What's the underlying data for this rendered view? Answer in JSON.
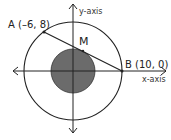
{
  "diagram": {
    "type": "coordinate-geometry",
    "colors": {
      "stroke": "#222222",
      "inner_fill": "#6b6b6b",
      "background": "#ffffff"
    },
    "axes": {
      "x_label": "x-axis",
      "y_label": "y-axis"
    },
    "points": {
      "A": {
        "name": "A",
        "coords": "(–6, 8)"
      },
      "B": {
        "name": "B",
        "coords": "(10, 0)"
      },
      "M": {
        "name": "M"
      }
    },
    "shapes": [
      {
        "kind": "circle",
        "role": "outer",
        "center": "origin",
        "passes_through": [
          "A",
          "B"
        ]
      },
      {
        "kind": "circle",
        "role": "inner",
        "center": "origin",
        "filled": true,
        "tangent_to": "AB at M"
      },
      {
        "kind": "segment",
        "from": "A",
        "to": "B"
      }
    ]
  },
  "labels": {
    "A": "A (–6, 8)",
    "B": "B (10, 0)",
    "M": "M",
    "x_axis": "x-axis",
    "y_axis": "y-axis"
  }
}
